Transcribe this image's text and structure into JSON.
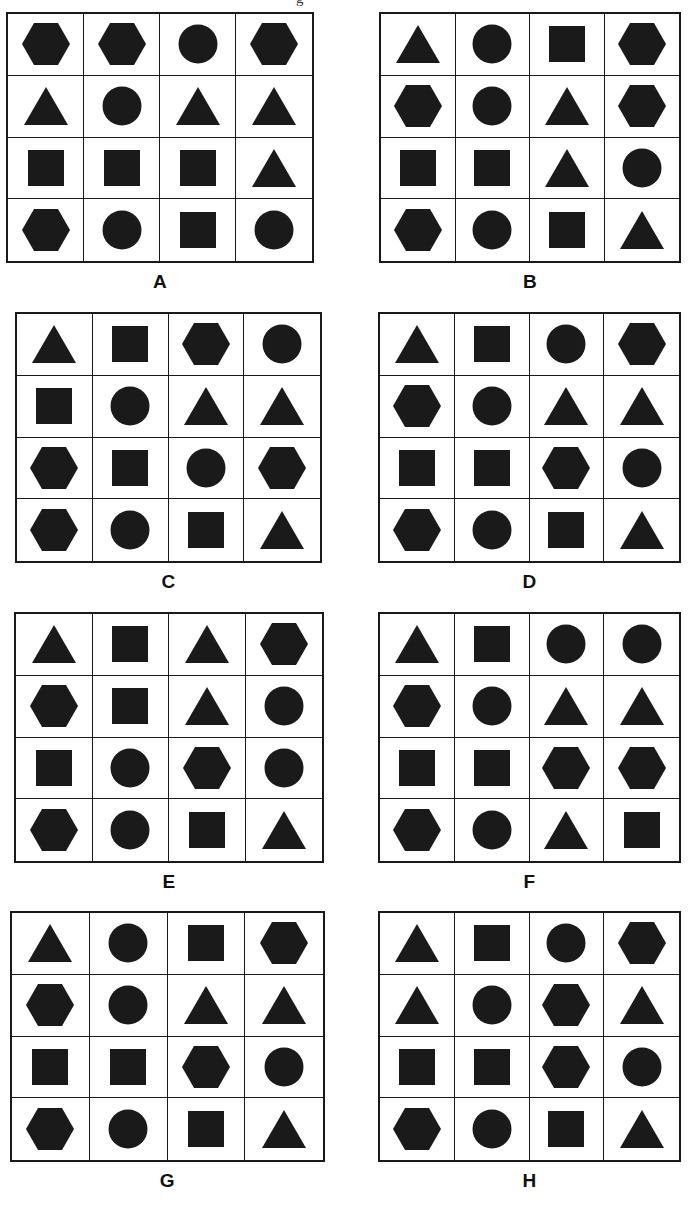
{
  "page": {
    "width": 691,
    "height": 1206,
    "background_color": "#ffffff",
    "shape_fill_color": "#1a1a1a",
    "border_color": "#1a1a1a",
    "stray_top_glyph": "g"
  },
  "shape_glyph_names": {
    "triangle": "triangle-shape",
    "square": "square-shape",
    "circle": "circle-shape",
    "hexagon": "hexagon-shape"
  },
  "panels": [
    {
      "label": "A",
      "x": 6,
      "y": 12,
      "width": 308,
      "height": 251,
      "label_y": 271,
      "rows": [
        [
          "hexagon",
          "hexagon",
          "circle",
          "hexagon"
        ],
        [
          "triangle",
          "circle",
          "triangle",
          "triangle"
        ],
        [
          "square",
          "square",
          "square",
          "triangle"
        ],
        [
          "hexagon",
          "circle",
          "square",
          "circle"
        ]
      ]
    },
    {
      "label": "B",
      "x": 379,
      "y": 12,
      "width": 302,
      "height": 251,
      "label_y": 271,
      "rows": [
        [
          "triangle",
          "circle",
          "square",
          "hexagon"
        ],
        [
          "hexagon",
          "circle",
          "triangle",
          "hexagon"
        ],
        [
          "square",
          "square",
          "triangle",
          "circle"
        ],
        [
          "hexagon",
          "circle",
          "square",
          "triangle"
        ]
      ]
    },
    {
      "label": "C",
      "x": 15,
      "y": 312,
      "width": 307,
      "height": 251,
      "label_y": 571,
      "rows": [
        [
          "triangle",
          "square",
          "hexagon",
          "circle"
        ],
        [
          "square",
          "circle",
          "triangle",
          "triangle"
        ],
        [
          "hexagon",
          "square",
          "circle",
          "hexagon"
        ],
        [
          "hexagon",
          "circle",
          "square",
          "triangle"
        ]
      ]
    },
    {
      "label": "D",
      "x": 378,
      "y": 312,
      "width": 303,
      "height": 251,
      "label_y": 571,
      "rows": [
        [
          "triangle",
          "square",
          "circle",
          "hexagon"
        ],
        [
          "hexagon",
          "circle",
          "triangle",
          "triangle"
        ],
        [
          "square",
          "square",
          "hexagon",
          "circle"
        ],
        [
          "hexagon",
          "circle",
          "square",
          "triangle"
        ]
      ]
    },
    {
      "label": "E",
      "x": 14,
      "y": 612,
      "width": 310,
      "height": 251,
      "label_y": 871,
      "rows": [
        [
          "triangle",
          "square",
          "triangle",
          "hexagon"
        ],
        [
          "hexagon",
          "square",
          "triangle",
          "circle"
        ],
        [
          "square",
          "circle",
          "hexagon",
          "circle"
        ],
        [
          "hexagon",
          "circle",
          "square",
          "triangle"
        ]
      ]
    },
    {
      "label": "F",
      "x": 378,
      "y": 612,
      "width": 303,
      "height": 251,
      "label_y": 871,
      "rows": [
        [
          "triangle",
          "square",
          "circle",
          "circle"
        ],
        [
          "hexagon",
          "circle",
          "triangle",
          "triangle"
        ],
        [
          "square",
          "square",
          "hexagon",
          "hexagon"
        ],
        [
          "hexagon",
          "circle",
          "triangle",
          "square"
        ]
      ]
    },
    {
      "label": "G",
      "x": 10,
      "y": 911,
      "width": 315,
      "height": 251,
      "label_y": 1170,
      "rows": [
        [
          "triangle",
          "circle",
          "square",
          "hexagon"
        ],
        [
          "hexagon",
          "circle",
          "triangle",
          "triangle"
        ],
        [
          "square",
          "square",
          "hexagon",
          "circle"
        ],
        [
          "hexagon",
          "circle",
          "square",
          "triangle"
        ]
      ]
    },
    {
      "label": "H",
      "x": 378,
      "y": 911,
      "width": 303,
      "height": 251,
      "label_y": 1170,
      "rows": [
        [
          "triangle",
          "square",
          "circle",
          "hexagon"
        ],
        [
          "triangle",
          "circle",
          "hexagon",
          "triangle"
        ],
        [
          "square",
          "square",
          "hexagon",
          "circle"
        ],
        [
          "hexagon",
          "circle",
          "square",
          "triangle"
        ]
      ]
    }
  ]
}
